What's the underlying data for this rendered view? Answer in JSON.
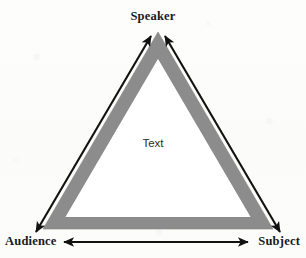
{
  "diagram": {
    "type": "rhetorical-triangle",
    "title": "",
    "vertices": [
      {
        "id": "speaker",
        "label": "Speaker",
        "position": "top"
      },
      {
        "id": "audience",
        "label": "Audience",
        "position": "bottom-left"
      },
      {
        "id": "subject",
        "label": "Subject",
        "position": "bottom-right"
      }
    ],
    "center": {
      "id": "text",
      "label": "Text"
    },
    "edges": [
      {
        "from": "audience",
        "to": "speaker",
        "arrow": "double",
        "side": "left"
      },
      {
        "from": "speaker",
        "to": "subject",
        "arrow": "double",
        "side": "right"
      },
      {
        "from": "audience",
        "to": "subject",
        "arrow": "double",
        "side": "bottom"
      }
    ],
    "colors": {
      "band": "#8c8c8c",
      "band_edge": "#7d7d7d",
      "interior": "#ffffff",
      "arrow": "#111111",
      "label": "#1a1a1a",
      "background": "#fcfcfb"
    }
  }
}
